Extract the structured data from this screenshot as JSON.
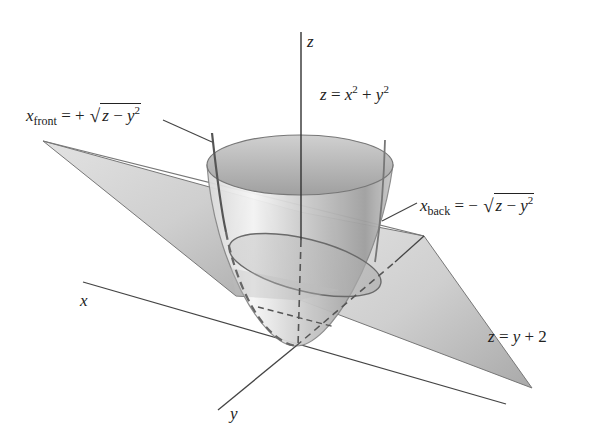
{
  "figure": {
    "colors": {
      "background": "#ffffff",
      "axis": "#444444",
      "surface_light": "#e8e8e8",
      "surface_dark": "#9a9a9a",
      "plane": "#c4c4c4",
      "text": "#222222"
    }
  },
  "axes": {
    "z_label": "z",
    "x_label": "x",
    "y_label": "y"
  },
  "equations": {
    "paraboloid": {
      "lhs": "z",
      "eq": "=",
      "t1": "x",
      "p1": "2",
      "plus": "+",
      "t2": "y",
      "p2": "2"
    },
    "plane": {
      "lhs": "z",
      "eq": "=",
      "t1": "y",
      "plus": "+",
      "const": "2"
    },
    "x_front": {
      "var": "x",
      "sub": "front",
      "eq": "=",
      "sign": "+",
      "rad": "√",
      "z": "z",
      "minus": "−",
      "y": "y",
      "pow": "2"
    },
    "x_back": {
      "var": "x",
      "sub": "back",
      "eq": "=",
      "sign": "−",
      "rad": "√",
      "z": "z",
      "minus": "−",
      "y": "y",
      "pow": "2"
    }
  }
}
